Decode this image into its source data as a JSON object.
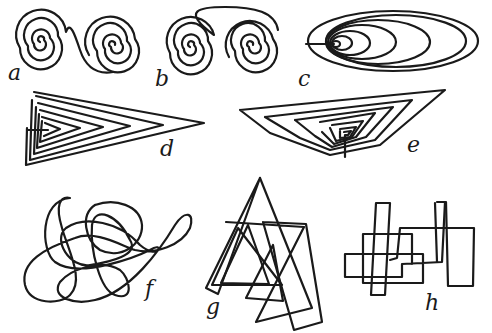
{
  "figure": {
    "background": "#ffffff",
    "stroke_color": "#1a1a1a",
    "panels": [
      {
        "id": "a",
        "label": "a",
        "description": "two spirals joined by an S-curve"
      },
      {
        "id": "b",
        "label": "b",
        "description": "two spirals joined by an arc over the top"
      },
      {
        "id": "c",
        "label": "c",
        "description": "elongated elliptical spiral"
      },
      {
        "id": "d",
        "label": "d",
        "description": "nested triangular spiral pointing right"
      },
      {
        "id": "e",
        "label": "e",
        "description": "nested inverted trapezoidal spiral"
      },
      {
        "id": "f",
        "label": "f",
        "description": "tangled looping scribble"
      },
      {
        "id": "g",
        "label": "g",
        "description": "overlapping triangles"
      },
      {
        "id": "h",
        "label": "h",
        "description": "overlapping rectangles"
      }
    ]
  }
}
